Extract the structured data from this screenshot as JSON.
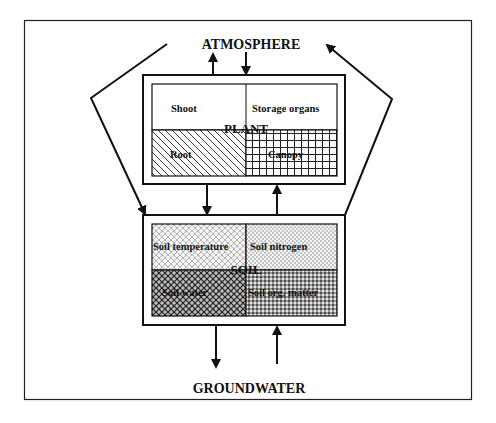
{
  "diagram": {
    "top_label": "ATMOSPHERE",
    "bottom_label": "GROUNDWATER",
    "plant": {
      "title": "PLANT",
      "cells": [
        {
          "label": "Shoot",
          "pattern": "none"
        },
        {
          "label": "Storage organs",
          "pattern": "none"
        },
        {
          "label": "Root",
          "pattern": "diagonal-hatch"
        },
        {
          "label": "Canopy",
          "pattern": "grid"
        }
      ]
    },
    "soil": {
      "title": "SOIL",
      "cells": [
        {
          "label": "Soil temperature",
          "pattern": "light-dots"
        },
        {
          "label": "Soil nitrogen",
          "pattern": "fine-dots"
        },
        {
          "label": "Soil water",
          "pattern": "crosshatch-dense"
        },
        {
          "label": "Soil org. matter",
          "pattern": "dense-dots"
        }
      ]
    },
    "flows": [
      {
        "from": "PLANT",
        "to": "ATMOSPHERE"
      },
      {
        "from": "ATMOSPHERE",
        "to": "PLANT"
      },
      {
        "from": "ATMOSPHERE",
        "to": "SOIL",
        "via": "left"
      },
      {
        "from": "SOIL",
        "to": "ATMOSPHERE",
        "via": "right"
      },
      {
        "from": "PLANT",
        "to": "SOIL"
      },
      {
        "from": "SOIL",
        "to": "PLANT"
      },
      {
        "from": "SOIL",
        "to": "GROUNDWATER"
      },
      {
        "from": "GROUNDWATER",
        "to": "SOIL"
      }
    ],
    "colors": {
      "ink": "#111111",
      "background": "#ffffff"
    }
  }
}
